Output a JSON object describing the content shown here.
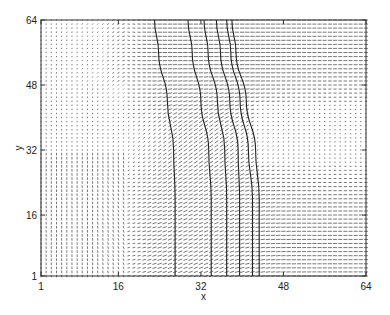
{
  "chart_data": {
    "type": "quiver",
    "title": "",
    "xlabel": "x",
    "ylabel": "y",
    "xlim": [
      1,
      64
    ],
    "ylim": [
      1,
      64
    ],
    "xticks": [
      1,
      16,
      32,
      48,
      64
    ],
    "yticks": [
      1,
      16,
      32,
      48,
      64
    ],
    "xtick_labels": [
      "1",
      "16",
      "32",
      "48",
      "64"
    ],
    "ytick_labels": [
      "1",
      "16",
      "32",
      "48",
      "64"
    ],
    "grid": false,
    "legend": null,
    "vector_field": {
      "grid_size": [
        64,
        64
      ],
      "description": "Velocity vectors on 64x64 grid; near-zero/vertical small arrows in left region (x<24), diagonal up-right arrows in middle band (x~20-40), horizontal rightward arrows in upper-right (y>44) and lower-right (y<28), weak/near-zero arrows in right-middle region (x>40, y~28-44)."
    },
    "contours": [
      {
        "points_xy": [
          [
            23.0,
            64
          ],
          [
            23.8,
            56
          ],
          [
            25.5,
            44
          ],
          [
            26.7,
            32
          ],
          [
            27.0,
            20
          ],
          [
            27.0,
            10
          ],
          [
            27.0,
            1
          ]
        ]
      },
      {
        "points_xy": [
          [
            29.5,
            64
          ],
          [
            30.3,
            56
          ],
          [
            32.0,
            44
          ],
          [
            33.5,
            32
          ],
          [
            34.0,
            20
          ],
          [
            34.0,
            10
          ],
          [
            34.0,
            1
          ]
        ]
      },
      {
        "points_xy": [
          [
            32.6,
            64
          ],
          [
            33.4,
            56
          ],
          [
            35.2,
            44
          ],
          [
            36.6,
            32
          ],
          [
            37.0,
            20
          ],
          [
            37.0,
            10
          ],
          [
            37.0,
            1
          ]
        ]
      },
      {
        "points_xy": [
          [
            35.0,
            64
          ],
          [
            35.8,
            56
          ],
          [
            37.6,
            44
          ],
          [
            39.2,
            32
          ],
          [
            39.5,
            20
          ],
          [
            39.5,
            10
          ],
          [
            39.5,
            1
          ]
        ]
      },
      {
        "points_xy": [
          [
            37.0,
            64
          ],
          [
            37.8,
            56
          ],
          [
            39.6,
            44
          ],
          [
            41.2,
            32
          ],
          [
            42.0,
            20
          ],
          [
            42.0,
            10
          ],
          [
            42.0,
            1
          ]
        ]
      },
      {
        "points_xy": [
          [
            38.0,
            64
          ],
          [
            38.8,
            56
          ],
          [
            40.8,
            44
          ],
          [
            42.6,
            32
          ],
          [
            43.3,
            20
          ],
          [
            43.3,
            10
          ],
          [
            43.3,
            1
          ]
        ]
      }
    ]
  },
  "colors": {
    "axis": "#333333",
    "arrow": "#555555",
    "contour": "#222222",
    "background": "#ffffff"
  }
}
